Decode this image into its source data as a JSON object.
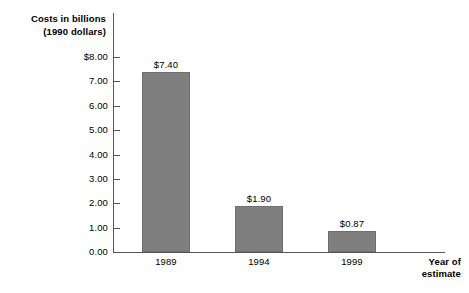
{
  "chart_data": {
    "type": "bar",
    "title": "",
    "categories": [
      "1989",
      "1994",
      "1999"
    ],
    "values": [
      7.4,
      1.9,
      0.87
    ],
    "data_labels": [
      "$7.40",
      "$1.90",
      "$0.87"
    ],
    "xlabel": "Year of estimate",
    "ylabel": "Costs in billions (1990 dollars)",
    "ylim": [
      0,
      8
    ],
    "ytick_values": [
      8.0,
      7.0,
      6.0,
      5.0,
      4.0,
      3.0,
      2.0,
      1.0,
      0.0
    ],
    "ytick_labels": [
      "$8.00",
      "7.00",
      "6.00",
      "5.00",
      "4.00",
      "3.00",
      "2.00",
      "1.00",
      "0.00"
    ],
    "grid": false,
    "legend": null,
    "bar_color": "#7f7f7f",
    "axis_color": "#555555",
    "background": "#ffffff"
  },
  "axes": {
    "y_title_line1": "Costs in billions",
    "y_title_line2": "(1990 dollars)",
    "x_title_line1": "Year of",
    "x_title_line2": "estimate"
  }
}
